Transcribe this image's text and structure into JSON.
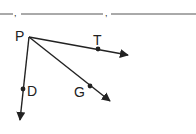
{
  "diagram": {
    "type": "geometry-rays",
    "vertex": {
      "label": "P",
      "x": 29,
      "y": 37
    },
    "rays": [
      {
        "name": "PT",
        "point_label": "T",
        "point": {
          "x": 98,
          "y": 49
        },
        "tip": {
          "x": 128,
          "y": 55
        }
      },
      {
        "name": "PG",
        "point_label": "G",
        "point": {
          "x": 90,
          "y": 86
        },
        "tip": {
          "x": 110,
          "y": 101
        }
      },
      {
        "name": "PD",
        "point_label": "D",
        "point": {
          "x": 23,
          "y": 89
        },
        "tip": {
          "x": 20,
          "y": 120
        }
      }
    ],
    "answer_line": {
      "blanks": 3,
      "separator": ","
    },
    "colors": {
      "stroke": "#222222",
      "blank_line": "#555555"
    }
  }
}
